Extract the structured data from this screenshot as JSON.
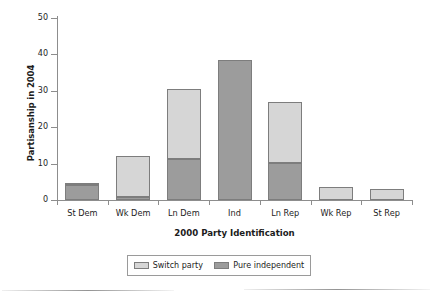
{
  "chart_data": {
    "type": "bar",
    "title": "",
    "xlabel": "2000 Party Identification",
    "ylabel": "Partisanship in 2004",
    "categories": [
      "St Dem",
      "Wk Dem",
      "Ln Dem",
      "Ind",
      "Ln Rep",
      "Wk Rep",
      "St Rep"
    ],
    "stacked": true,
    "ylim": [
      0,
      50
    ],
    "yticks": [
      0,
      10,
      20,
      30,
      40,
      50
    ],
    "ytick_labels": [
      "0",
      "10",
      "20",
      "30",
      "40",
      "50"
    ],
    "grid": false,
    "legend_position": "bottom-center",
    "series": [
      {
        "name": "Pure independent",
        "color": "#9c9c9c",
        "values": [
          4.0,
          0.8,
          11.3,
          38.5,
          10.2,
          0.0,
          0.0
        ]
      },
      {
        "name": "Switch party",
        "color": "#d6d6d6",
        "values": [
          0.8,
          11.2,
          19.2,
          0.0,
          16.8,
          3.5,
          3.0
        ]
      }
    ],
    "totals": [
      4.8,
      12.0,
      30.5,
      38.5,
      27.0,
      3.5,
      3.0
    ]
  },
  "legend": {
    "items": [
      {
        "label": "Switch party",
        "color": "#d6d6d6"
      },
      {
        "label": "Pure independent",
        "color": "#9c9c9c"
      }
    ]
  },
  "colors": {
    "switch_party": "#d6d6d6",
    "pure_independent": "#9c9c9c",
    "bar_border": "#7d7d7d",
    "axis": "#8d8d8d",
    "text": "#1c1c1c",
    "background": "#ffffff"
  }
}
